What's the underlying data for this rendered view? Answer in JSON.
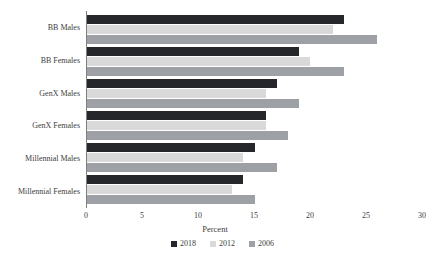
{
  "chart_data": {
    "type": "bar",
    "orientation": "horizontal",
    "title": "",
    "xlabel": "Percent",
    "ylabel": "",
    "xlim": [
      0,
      30
    ],
    "xticks": [
      0,
      5,
      10,
      15,
      20,
      25,
      30
    ],
    "grid": false,
    "legend_position": "bottom",
    "categories": [
      "BB Males",
      "BB Females",
      "GenX Males",
      "GenX Females",
      "Millennial Males",
      "Millennial Females"
    ],
    "series": [
      {
        "name": "2018",
        "color": "#26272b",
        "values": [
          23,
          19,
          17,
          16,
          15,
          14
        ]
      },
      {
        "name": "2012",
        "color": "#d9d9d9",
        "values": [
          22,
          20,
          16,
          16,
          14,
          13
        ]
      },
      {
        "name": "2006",
        "color": "#9da0a4",
        "values": [
          26,
          23,
          19,
          18,
          17,
          15
        ]
      }
    ]
  },
  "colors": {
    "background": "#ffffff",
    "axis_line": "#7f7f7f",
    "text": "#3d3d3d"
  }
}
